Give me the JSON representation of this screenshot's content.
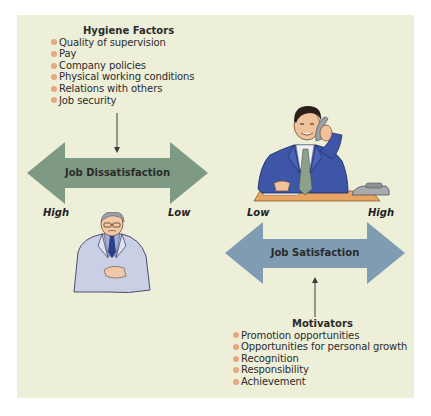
{
  "hygiene": {
    "title": "Hygiene Factors",
    "items": [
      "Quality of supervision",
      "Pay",
      "Company policies",
      "Physical working conditions",
      "Relations with others",
      "Job security"
    ]
  },
  "dissatisfaction_arrow": {
    "label": "Job Dissatisfaction",
    "left_label": "High",
    "right_label": "Low",
    "color": "#7e9a84"
  },
  "satisfaction_arrow": {
    "label": "Job Satisfaction",
    "left_label": "Low",
    "right_label": "High",
    "color": "#7f9cb3"
  },
  "motivators": {
    "title": "Motivators",
    "items": [
      "Promotion opportunities",
      "Opportunities for personal growth",
      "Recognition",
      "Responsibility",
      "Achievement"
    ]
  },
  "illustrations": {
    "dissatisfied_person": "older-man-in-lab-coat-icon",
    "satisfied_person": "smiling-businessman-on-phone-icon"
  },
  "colors": {
    "background": "#eeefd9",
    "bullet": "#e9a77c",
    "text": "#2b2b2b"
  }
}
